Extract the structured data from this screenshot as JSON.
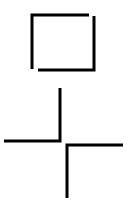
{
  "diagram": {
    "title": "",
    "stroke_color": "#000000",
    "background_color": "#ffffff",
    "shapes": [
      {
        "name": "open-square",
        "kind": "square made of two offset L-shaped strokes"
      },
      {
        "name": "upper-corner",
        "kind": "L-shaped corner (vertical then horizontal to left)"
      },
      {
        "name": "lower-corner",
        "kind": "L-shaped corner (horizontal right then vertical down)"
      }
    ]
  }
}
